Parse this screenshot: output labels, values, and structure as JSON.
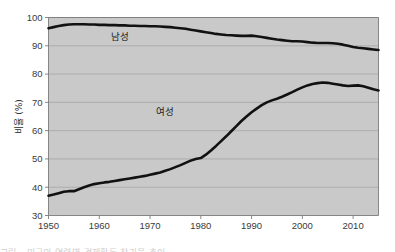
{
  "figure": {
    "background_color": "#ffffff",
    "plot_background_color": "#c9c9c9",
    "gridline_color": "#a9a9a9",
    "axis_color": "#7a7a7a",
    "line_color": "#111111"
  },
  "chart_data": {
    "type": "line",
    "title": "",
    "xlabel": "",
    "ylabel": "비율 (%)",
    "xlim": [
      1950,
      2015
    ],
    "ylim": [
      30,
      100
    ],
    "grid": true,
    "legend_position": "inline-labels",
    "xticks": [
      1950,
      1960,
      1970,
      1980,
      1990,
      2000,
      2010
    ],
    "xtick_labels": [
      "1950",
      "1960",
      "1970",
      "1980",
      "1990",
      "2000",
      "2010"
    ],
    "yticks": [
      30,
      40,
      50,
      60,
      70,
      80,
      90,
      100
    ],
    "ytick_labels": [
      "30",
      "40",
      "50",
      "60",
      "70",
      "80",
      "90",
      "100"
    ],
    "x": [
      1950,
      1951,
      1952,
      1953,
      1954,
      1955,
      1956,
      1957,
      1958,
      1959,
      1960,
      1961,
      1962,
      1963,
      1964,
      1965,
      1966,
      1967,
      1968,
      1969,
      1970,
      1971,
      1972,
      1973,
      1974,
      1975,
      1976,
      1977,
      1978,
      1979,
      1980,
      1981,
      1982,
      1983,
      1984,
      1985,
      1986,
      1987,
      1988,
      1989,
      1990,
      1991,
      1992,
      1993,
      1994,
      1995,
      1996,
      1997,
      1998,
      1999,
      2000,
      2001,
      2002,
      2003,
      2004,
      2005,
      2006,
      2007,
      2008,
      2009,
      2010,
      2011,
      2012,
      2013,
      2014,
      2015
    ],
    "series": [
      {
        "name": "남성",
        "label": "남성",
        "label_x": 1964,
        "label_y": 92.0,
        "values": [
          96.2,
          96.6,
          97.0,
          97.3,
          97.5,
          97.6,
          97.6,
          97.6,
          97.5,
          97.5,
          97.4,
          97.4,
          97.3,
          97.3,
          97.2,
          97.2,
          97.1,
          97.1,
          97.0,
          97.0,
          96.9,
          96.9,
          96.8,
          96.7,
          96.6,
          96.4,
          96.2,
          96.0,
          95.7,
          95.4,
          95.1,
          94.8,
          94.5,
          94.2,
          94.0,
          93.8,
          93.7,
          93.6,
          93.5,
          93.5,
          93.6,
          93.4,
          93.1,
          92.8,
          92.5,
          92.2,
          92.0,
          91.8,
          91.6,
          91.6,
          91.5,
          91.3,
          91.1,
          91.0,
          91.0,
          91.0,
          90.9,
          90.7,
          90.4,
          90.0,
          89.6,
          89.3,
          89.1,
          88.9,
          88.7,
          88.5
        ]
      },
      {
        "name": "여성",
        "label": "여성",
        "label_x": 1973,
        "label_y": 65.5,
        "values": [
          37.0,
          37.4,
          37.9,
          38.4,
          38.6,
          38.6,
          39.3,
          40.0,
          40.6,
          41.1,
          41.4,
          41.7,
          41.9,
          42.2,
          42.5,
          42.8,
          43.1,
          43.4,
          43.7,
          44.0,
          44.4,
          44.8,
          45.2,
          45.8,
          46.4,
          47.1,
          47.8,
          48.6,
          49.4,
          50.0,
          50.3,
          51.5,
          53.0,
          54.6,
          56.3,
          58.0,
          59.8,
          61.6,
          63.4,
          65.0,
          66.5,
          67.8,
          69.0,
          70.0,
          70.7,
          71.3,
          72.0,
          72.8,
          73.6,
          74.5,
          75.3,
          76.0,
          76.5,
          76.8,
          77.0,
          76.9,
          76.6,
          76.3,
          76.0,
          75.8,
          75.9,
          76.0,
          75.7,
          75.2,
          74.6,
          74.2
        ]
      }
    ]
  },
  "caption": {
    "truncated_text": "그림 . 미국의 연령별 경제활동 참가율 추이"
  }
}
